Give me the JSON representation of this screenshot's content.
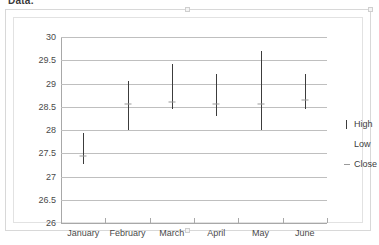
{
  "caption": {
    "text": "Data:"
  },
  "legend": {
    "position": "right",
    "items": [
      {
        "label": "High",
        "marker": "vertical-line-marker"
      },
      {
        "label": "Low",
        "marker": "blank-marker"
      },
      {
        "label": "Close",
        "marker": "dash-marker"
      }
    ]
  },
  "colors": {
    "bar": "#3c3c3c",
    "gridline": "#bfbfbf",
    "axis": "#a8a8a8",
    "close_marker": "#9a9a9a",
    "text": "#4a4a4a",
    "frame": "#d8d8d8"
  },
  "chart_data": {
    "type": "bar",
    "subtype": "high-low-close stock chart",
    "title": "",
    "xlabel": "",
    "ylabel": "",
    "grid": true,
    "legend_position": "right",
    "categories": [
      "January",
      "February",
      "March",
      "April",
      "May",
      "June"
    ],
    "ylim": [
      26,
      30
    ],
    "yticks": [
      26,
      26.5,
      27,
      27.5,
      28,
      28.5,
      29,
      29.5,
      30
    ],
    "ytick_labels": [
      "26",
      "26.5",
      "27",
      "27.5",
      "28",
      "28.5",
      "29",
      "29.5",
      "30"
    ],
    "series": [
      {
        "name": "High",
        "values": [
          27.93,
          29.05,
          29.43,
          29.2,
          29.7,
          29.2
        ]
      },
      {
        "name": "Low",
        "values": [
          27.27,
          28.0,
          28.45,
          28.3,
          28.0,
          28.45
        ]
      },
      {
        "name": "Close",
        "values": [
          27.45,
          28.55,
          28.6,
          28.55,
          28.55,
          28.65
        ]
      }
    ]
  }
}
